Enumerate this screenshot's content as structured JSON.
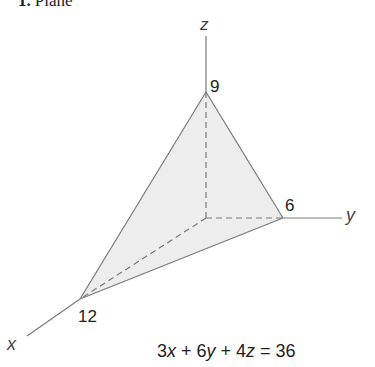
{
  "title": {
    "number": "1.",
    "label": "Plane"
  },
  "axes": {
    "x": {
      "label": "x",
      "intercept": "12"
    },
    "y": {
      "label": "y",
      "intercept": "6"
    },
    "z": {
      "label": "z",
      "intercept": "9"
    }
  },
  "equation": {
    "c1": "3",
    "v1": "x",
    "op1": " + ",
    "c2": "6",
    "v2": "y",
    "op2": " + ",
    "c3": "4",
    "v3": "z",
    "eq": " = ",
    "rhs": "36",
    "full": "3x + 6y + 4z = 36"
  },
  "colors": {
    "fill": "#ededed",
    "line": "#7a7a7a",
    "text": "#222222"
  }
}
